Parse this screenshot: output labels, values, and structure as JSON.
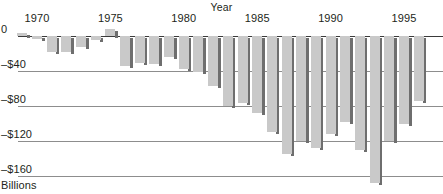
{
  "chart_data": {
    "type": "bar",
    "title": "",
    "xlabel": "Year",
    "ylabel": "Billions",
    "ytick_labels": [
      "0",
      "–$40",
      "–$80",
      "–$120",
      "–$160"
    ],
    "ytick_values": [
      0,
      -40,
      -80,
      -120,
      -160
    ],
    "ylim": [
      -170,
      8
    ],
    "xtick_labels": [
      "1970",
      "1975",
      "1980",
      "1985",
      "1990",
      "1995"
    ],
    "xtick_values": [
      1970,
      1975,
      1980,
      1985,
      1990,
      1995
    ],
    "xlim": [
      1969,
      1996
    ],
    "grid": true,
    "legend": false,
    "bar_color": "#c9c9c9",
    "shadow_color": "#6e6e6e",
    "gridline_color": "#8d8d8d",
    "axis_color": "#3a3a3a",
    "categories": [
      1969,
      1970,
      1971,
      1972,
      1973,
      1974,
      1975,
      1976,
      1977,
      1978,
      1979,
      1980,
      1981,
      1982,
      1983,
      1984,
      1985,
      1986,
      1987,
      1988,
      1989,
      1990,
      1991,
      1992,
      1993,
      1994,
      1995,
      1996
    ],
    "values": [
      3,
      -3,
      -23,
      -23,
      -15,
      -6,
      -53,
      -74,
      -54,
      -59,
      -40,
      -74,
      -79,
      -128,
      -208,
      -185,
      -212,
      -221,
      -150,
      -155,
      -152,
      -221,
      -269,
      -290,
      -255,
      -203,
      -164,
      -107
    ],
    "display_values": [
      3,
      -3,
      -18,
      -18,
      -12,
      -5,
      8,
      -34,
      -31,
      -32,
      -24,
      -38,
      -41,
      -57,
      -80,
      -76,
      -88,
      -110,
      -135,
      -120,
      -128,
      -112,
      -98,
      -130,
      -168,
      -120,
      -100,
      -74
    ]
  }
}
